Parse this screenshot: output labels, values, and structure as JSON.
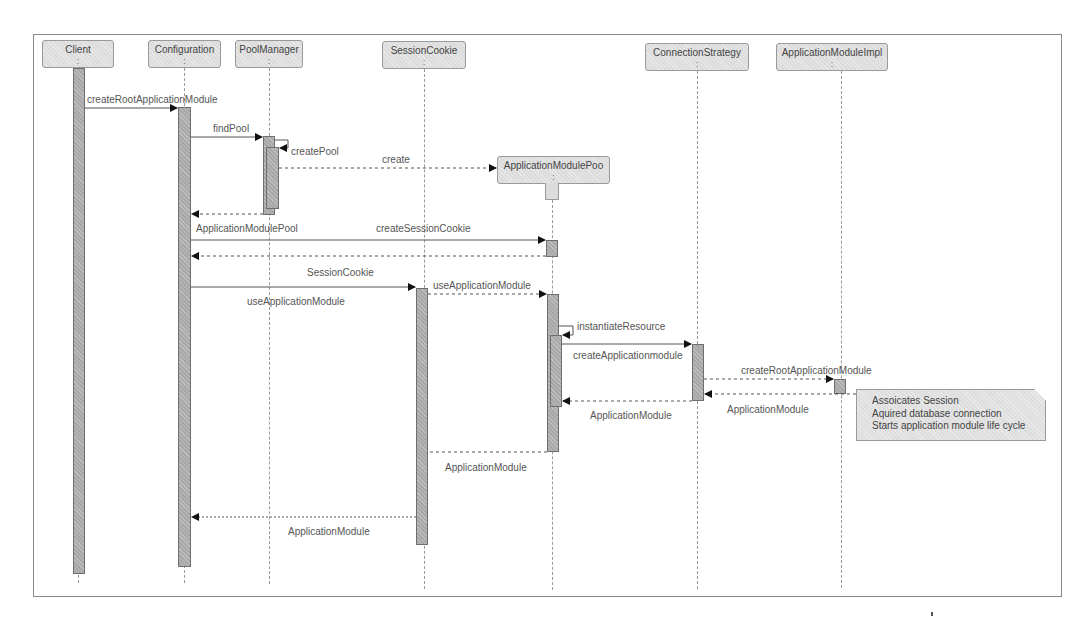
{
  "diagram": {
    "type": "uml-sequence",
    "lifelines": [
      {
        "id": "client",
        "label": "Client",
        "colon": ":"
      },
      {
        "id": "configuration",
        "label": "Configuration",
        "colon": ":"
      },
      {
        "id": "poolmanager",
        "label": "PoolManager",
        "colon": ":"
      },
      {
        "id": "sessioncookie",
        "label": "SessionCookie",
        "colon": ":"
      },
      {
        "id": "connectionstrategy",
        "label": "ConnectionStrategy",
        "colon": ":"
      },
      {
        "id": "applicationmoduleimpl",
        "label": "ApplicationModuleImpl",
        "colon": ":"
      },
      {
        "id": "applicationmodulepool",
        "label": "ApplicationModulePoo",
        "colon": ":"
      }
    ],
    "messages": [
      {
        "from": "client",
        "to": "configuration",
        "label": "createRootApplicationModule",
        "kind": "sync"
      },
      {
        "from": "configuration",
        "to": "poolmanager",
        "label": "findPool",
        "kind": "sync"
      },
      {
        "from": "poolmanager",
        "to": "poolmanager",
        "label": "createPool",
        "kind": "self"
      },
      {
        "from": "poolmanager",
        "to": "applicationmodulepool",
        "label": "create",
        "kind": "create"
      },
      {
        "from": "poolmanager",
        "to": "configuration",
        "label": "ApplicationModulePool",
        "kind": "return"
      },
      {
        "from": "configuration",
        "to": "applicationmodulepool",
        "label": "createSessionCookie",
        "kind": "sync"
      },
      {
        "from": "applicationmodulepool",
        "to": "configuration",
        "label": "SessionCookie",
        "kind": "return"
      },
      {
        "from": "configuration",
        "to": "sessioncookie",
        "label": "useApplicationModule",
        "kind": "sync"
      },
      {
        "from": "sessioncookie",
        "to": "applicationmodulepool",
        "label": "useApplicationModule",
        "kind": "async"
      },
      {
        "from": "applicationmodulepool",
        "to": "applicationmodulepool",
        "label": "instantiateResource",
        "kind": "self"
      },
      {
        "from": "applicationmodulepool",
        "to": "connectionstrategy",
        "label": "createApplicationmodule",
        "kind": "sync"
      },
      {
        "from": "connectionstrategy",
        "to": "applicationmoduleimpl",
        "label": "createRootApplicationModule",
        "kind": "async"
      },
      {
        "from": "applicationmoduleimpl",
        "to": "connectionstrategy",
        "label": "ApplicationModule",
        "kind": "return"
      },
      {
        "from": "connectionstrategy",
        "to": "applicationmodulepool",
        "label": "ApplicationModule",
        "kind": "return"
      },
      {
        "from": "applicationmodulepool",
        "to": "sessioncookie",
        "label": "ApplicationModule",
        "kind": "return"
      },
      {
        "from": "sessioncookie",
        "to": "configuration",
        "label": "ApplicationModule",
        "kind": "return"
      }
    ],
    "note": {
      "lines": [
        "Assoicates Session",
        "Aquired database connection",
        "Starts application module life cycle"
      ]
    },
    "colors": {
      "box_fill": "#dcdcdc",
      "activation_fill": "#a8a8a8",
      "line": "#555555",
      "frame": "#8a8a8a"
    }
  }
}
